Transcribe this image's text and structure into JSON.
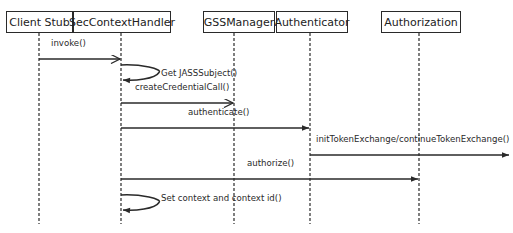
{
  "diagram": {
    "type": "sequence",
    "participants": [
      {
        "id": "client",
        "label": "Client Stub",
        "x": 39,
        "box_left": 6,
        "box_width": 67
      },
      {
        "id": "handler",
        "label": "SecContextHandler",
        "x": 121,
        "box_left": 73,
        "box_width": 98
      },
      {
        "id": "gss",
        "label": "GSSManager",
        "x": 234,
        "box_left": 203,
        "box_width": 72
      },
      {
        "id": "auth",
        "label": "Authenticator",
        "x": 310,
        "box_left": 276,
        "box_width": 72
      },
      {
        "id": "authz",
        "label": "Authorization",
        "x": 419,
        "box_left": 381,
        "box_width": 80
      }
    ],
    "messages": [
      {
        "label": "invoke()",
        "from": "client",
        "to": "handler",
        "y": 59,
        "arrow": "open",
        "label_x": 51,
        "label_y": 44
      },
      {
        "label": "Get JASSSubject()",
        "from": "handler",
        "to": "handler",
        "y": 74,
        "self": true,
        "label_x": 161,
        "label_y": 74
      },
      {
        "label": "createCredentialCall()",
        "from": "handler",
        "to": "gss",
        "y": 103,
        "arrow": "open",
        "label_x": 135,
        "label_y": 88
      },
      {
        "label": "authenticate()",
        "from": "handler",
        "to": "auth",
        "y": 128,
        "arrow": "filled",
        "label_x": 188,
        "label_y": 113
      },
      {
        "label": "initTokenExchange/continueTokenExchange()",
        "from": "auth",
        "to": "offscreen",
        "y": 155,
        "arrow": "filled",
        "label_x": 316,
        "label_y": 140
      },
      {
        "label": "authorize()",
        "from": "handler",
        "to": "authz",
        "y": 179,
        "arrow": "filled",
        "label_x": 247,
        "label_y": 164
      },
      {
        "label": "Set context and context id()",
        "from": "handler",
        "to": "handler",
        "y": 204,
        "self": true,
        "label_x": 161,
        "label_y": 199
      }
    ],
    "colors": {
      "line": "#2a2a2a",
      "background": "#ffffff"
    }
  }
}
